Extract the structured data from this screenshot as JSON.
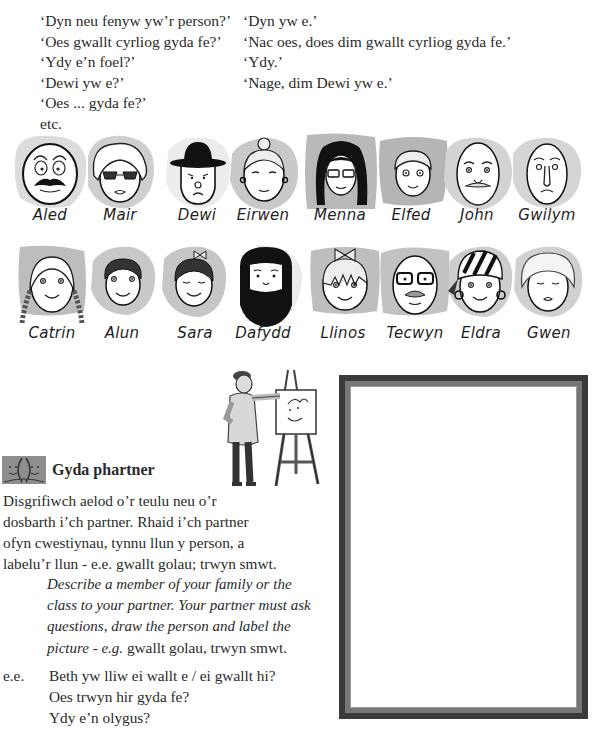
{
  "dialogue": {
    "questions": [
      "‘Dyn neu fenyw yw’r person?’",
      "‘Oes gwallt cyrliog gyda fe?’",
      "‘Ydy e’n foel?’",
      "‘Dewi yw e?’",
      "‘Oes ... gyda fe?’",
      "etc."
    ],
    "answers": [
      "‘Dyn yw e.’",
      "‘Nac oes, does dim gwallt cyrliog gyda fe.’",
      "‘Ydy.’",
      "‘Nage, dim Dewi yw e.’"
    ]
  },
  "faces": {
    "row1": [
      {
        "name": "Aled",
        "feature": "bald-moustache"
      },
      {
        "name": "Mair",
        "feature": "curly-sunglasses"
      },
      {
        "name": "Dewi",
        "feature": "bowler-hat"
      },
      {
        "name": "Eirwen",
        "feature": "bun-earrings"
      },
      {
        "name": "Menna",
        "feature": "long-dark-hair-glasses"
      },
      {
        "name": "Elfed",
        "feature": "short-hair-freckles"
      },
      {
        "name": "John",
        "feature": "bald-beard"
      },
      {
        "name": "Gwilym",
        "feature": "bald-long-nose"
      }
    ],
    "row2": [
      {
        "name": "Catrin",
        "feature": "plaits"
      },
      {
        "name": "Alun",
        "feature": "short-curly"
      },
      {
        "name": "Sara",
        "feature": "curly-bow"
      },
      {
        "name": "Dafydd",
        "feature": "full-beard"
      },
      {
        "name": "Llinos",
        "feature": "bow-fringe"
      },
      {
        "name": "Tecwyn",
        "feature": "bald-glasses-moustache"
      },
      {
        "name": "Eldra",
        "feature": "bandana-earrings"
      },
      {
        "name": "Gwen",
        "feature": "curly-grey"
      }
    ]
  },
  "partner_section": {
    "icon": "two-faces-icon",
    "heading": "Gyda phartner",
    "welsh_lines": [
      "Disgrifiwch aelod o’r teulu neu o’r",
      "dosbarth i’ch partner. Rhaid i’ch partner",
      "ofyn cwestiynau, tynnu llun y person, a",
      "labelu’r llun - e.e. gwallt golau; trwyn smwt."
    ],
    "english_lines": [
      {
        "italic": "Describe a member of your family or the",
        "plain": ""
      },
      {
        "italic": "class to your partner. Your partner must ask",
        "plain": ""
      },
      {
        "italic": "questions, draw the person and label the",
        "plain": ""
      },
      {
        "italic": "picture - e.g.",
        "plain": " gwallt golau, trwyn smwt."
      }
    ],
    "example_label": "e.e.",
    "examples": [
      "Beth yw lliw ei wallt e / ei gwallt hi?",
      "Oes trwyn hir gyda fe?",
      "Ydy e’n olygus?"
    ]
  },
  "illustration": {
    "subject": "artist-painting-at-easel-icon"
  },
  "drawing_frame": {
    "purpose": "blank picture frame for drawing",
    "outer_color": "#3a3a3a",
    "inner_color": "#777777"
  }
}
